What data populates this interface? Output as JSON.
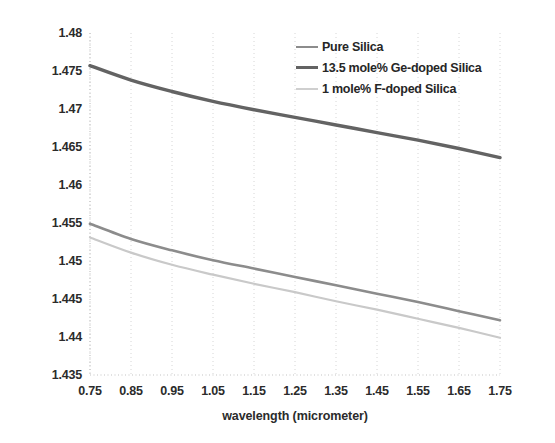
{
  "chart_data": {
    "type": "line",
    "title": "",
    "xlabel": "wavelength (micrometer)",
    "ylabel": "Index",
    "xlim": [
      0.75,
      1.75
    ],
    "ylim": [
      1.435,
      1.48
    ],
    "xticks": [
      "0.75",
      "0.85",
      "0.95",
      "1.05",
      "1.15",
      "1.25",
      "1.35",
      "1.45",
      "1.55",
      "1.65",
      "1.75"
    ],
    "yticks": [
      "1.435",
      "1.44",
      "1.445",
      "1.45",
      "1.455",
      "1.46",
      "1.465",
      "1.47",
      "1.475",
      "1.48"
    ],
    "grid": true,
    "grid_style": "dotted",
    "legend_position": "top-right",
    "x": [
      0.75,
      0.85,
      0.95,
      1.05,
      1.15,
      1.25,
      1.35,
      1.45,
      1.55,
      1.65,
      1.75
    ],
    "series": [
      {
        "name": "Pure Silica",
        "color": "#8c8c8c",
        "width": 2.6,
        "values": [
          1.4549,
          1.4529,
          1.4514,
          1.4501,
          1.449,
          1.4479,
          1.4468,
          1.4457,
          1.4446,
          1.4434,
          1.4422
        ]
      },
      {
        "name": "13.5 mole% Ge-doped Silica",
        "color": "#636363",
        "width": 3.4,
        "values": [
          1.4757,
          1.4738,
          1.4723,
          1.471,
          1.4699,
          1.4689,
          1.4679,
          1.4669,
          1.4659,
          1.4648,
          1.4636
        ]
      },
      {
        "name": "1 mole% F-doped Silica",
        "color": "#c9c9c9",
        "width": 2.2,
        "values": [
          1.4531,
          1.4511,
          1.4495,
          1.4482,
          1.447,
          1.4459,
          1.4447,
          1.4436,
          1.4424,
          1.4412,
          1.4399
        ]
      }
    ]
  },
  "legend": {
    "items": [
      {
        "label": "Pure Silica",
        "color": "#8c8c8c",
        "width": "2.6px"
      },
      {
        "label": "13.5 mole% Ge-doped Silica",
        "color": "#636363",
        "width": "3.6px"
      },
      {
        "label": "1 mole% F-doped Silica",
        "color": "#cfcfcf",
        "width": "2.2px"
      }
    ]
  },
  "axes": {
    "y_title": "Index",
    "x_title": "wavelength (micrometer)"
  },
  "colors": {
    "text": "#2b2b2b",
    "grid": "#d6d6d6",
    "axis": "#c4c4c4",
    "background": "#ffffff"
  }
}
